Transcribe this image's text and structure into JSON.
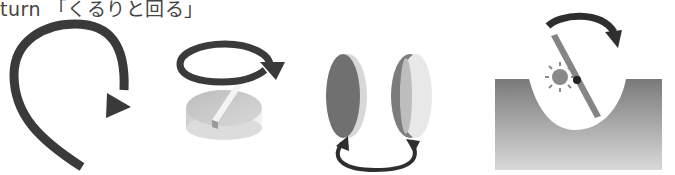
{
  "caption": "turn 「くるりと回る」",
  "figures": [
    {
      "name": "circular-arrow",
      "description": "large looping arrow"
    },
    {
      "name": "spinning-disc",
      "description": "disc with handle and rotation arrow"
    },
    {
      "name": "flipping-discs",
      "description": "two discs flipping with curved arrow"
    },
    {
      "name": "earth-rotation",
      "description": "tilted bar with sun rotating over ground"
    }
  ],
  "colors": {
    "arrow": "#3a3a3a",
    "ground_top": "#7a7a7a",
    "ground_bottom": "#d8d8d8",
    "disc_dark": "#777777",
    "disc_light": "#e6e6e6",
    "sun": "#8a8a8a"
  }
}
